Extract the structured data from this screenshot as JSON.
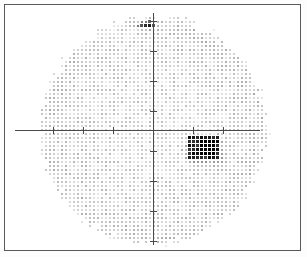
{
  "figure": {
    "title": "",
    "frame_color": "#5a5a5a",
    "background_color": "#ffffff",
    "axis_color": "#4a4a4a",
    "width_px": 307,
    "height_px": 257
  },
  "chart_data": {
    "type": "heatmap",
    "title": "",
    "subtitle": "",
    "xlabel": "",
    "ylabel": "",
    "grid": false,
    "legend": "none",
    "xlim": [
      -30,
      30
    ],
    "ylim": [
      -30,
      30
    ],
    "x_ticks": [
      -30,
      -20,
      -10,
      0,
      10,
      20,
      30
    ],
    "y_ticks": [
      -30,
      -20,
      -10,
      0,
      10,
      20,
      30
    ],
    "x_tick_labels": [
      "",
      "",
      "",
      "",
      "",
      "",
      ""
    ],
    "y_tick_labels": [
      "",
      "",
      "",
      "",
      "",
      "",
      ""
    ],
    "field_shape": "oval",
    "field_center_px": [
      148,
      125
    ],
    "field_radius_x_px": 117,
    "field_radius_y_px": 118,
    "dot_grid_spacing_px": 4.0,
    "dot_size_px": 2,
    "base_gray_level": 0.16,
    "gray_scale_min": "#ffffff",
    "gray_scale_max": "#000000",
    "regions": [
      {
        "name": "upper-cluster",
        "shape": "ellipse",
        "center_px": [
          141,
          20
        ],
        "radius_x_px": 11,
        "radius_y_px": 5,
        "gray_level": 0.62,
        "note": "small dark bowtie-shaped cluster near superior field, just left of vertical meridian"
      },
      {
        "name": "scotoma-rectangle",
        "shape": "rect",
        "x_px": 183,
        "y_px": 131,
        "width_px": 32,
        "height_px": 22,
        "gray_level": 0.7,
        "note": "dense dark rectangular defect in inferior-temporal quadrant, abutting horizontal meridian"
      },
      {
        "name": "scotoma-core",
        "shape": "rect",
        "x_px": 195,
        "y_px": 133,
        "width_px": 16,
        "height_px": 16,
        "gray_level": 0.92,
        "note": "near-black core of the scotoma"
      },
      {
        "name": "scotoma-halo",
        "shape": "ellipse",
        "center_px": [
          199,
          147
        ],
        "radius_x_px": 26,
        "radius_y_px": 18,
        "gray_level": 0.3,
        "note": "mid-gray penumbra surrounding the scotoma"
      },
      {
        "name": "superior-nasal-fade",
        "shape": "ellipse",
        "center_px": [
          110,
          28
        ],
        "radius_x_px": 34,
        "radius_y_px": 18,
        "gray_level": -0.08,
        "note": "slightly lighter / sparser dots superior-nasally"
      }
    ]
  },
  "axes": {
    "horizontal": {
      "name": "horizontal-meridian",
      "start_px": [
        10,
        125
      ],
      "end_px": [
        255,
        125
      ],
      "ticks_px": [
        48,
        78,
        108,
        148,
        188,
        218
      ]
    },
    "vertical": {
      "name": "vertical-meridian",
      "start_px": [
        148,
        8
      ],
      "end_px": [
        148,
        240
      ],
      "ticks_px": [
        16,
        46,
        76,
        106,
        146,
        176,
        206,
        236
      ]
    }
  }
}
